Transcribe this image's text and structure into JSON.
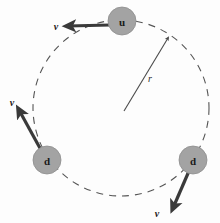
{
  "figure": {
    "background_color": "#fdfdfd",
    "orbit": {
      "center_x": 121,
      "center_y": 108,
      "radius": 88,
      "stroke_color": "#555555",
      "stroke_width": 1.1,
      "dash_pattern": "7 6",
      "style": "dashed"
    },
    "radius_indicator": {
      "label": "r",
      "label_x": 150,
      "label_y": 82,
      "from_x": 124,
      "from_y": 111,
      "to_x": 168,
      "to_y": 38,
      "stroke_color": "#4a4a4a",
      "stroke_width": 1.1
    },
    "particles": [
      {
        "id": "particle-top",
        "label": "u",
        "cx": 122,
        "cy": 21,
        "r": 14,
        "fill": "#a3a3a3",
        "stroke": "#8e8e8e",
        "velocity": {
          "label": "v",
          "from_x": 110,
          "from_y": 25,
          "to_x": 68,
          "to_y": 26,
          "label_x": 56,
          "label_y": 30,
          "stroke_color": "#3a3a3a",
          "stroke_width": 3.2
        }
      },
      {
        "id": "particle-lower-left",
        "label": "d",
        "cx": 47,
        "cy": 160,
        "r": 14,
        "fill": "#a3a3a3",
        "stroke": "#8e8e8e",
        "velocity": {
          "label": "v",
          "from_x": 41,
          "from_y": 150,
          "to_x": 19,
          "to_y": 110,
          "label_x": 12,
          "label_y": 106,
          "stroke_color": "#3a3a3a",
          "stroke_width": 3.2
        }
      },
      {
        "id": "particle-right",
        "label": "d",
        "cx": 193,
        "cy": 160,
        "r": 14,
        "fill": "#a3a3a3",
        "stroke": "#8e8e8e",
        "velocity": {
          "label": "v",
          "from_x": 189,
          "from_y": 171,
          "to_x": 173,
          "to_y": 208,
          "label_x": 157,
          "label_y": 217,
          "stroke_color": "#3a3a3a",
          "stroke_width": 3.2
        }
      }
    ],
    "colors": {
      "particle_fill": "#a3a3a3",
      "arrow": "#3a3a3a",
      "orbit": "#555555",
      "text": "#1a1a1a"
    }
  }
}
